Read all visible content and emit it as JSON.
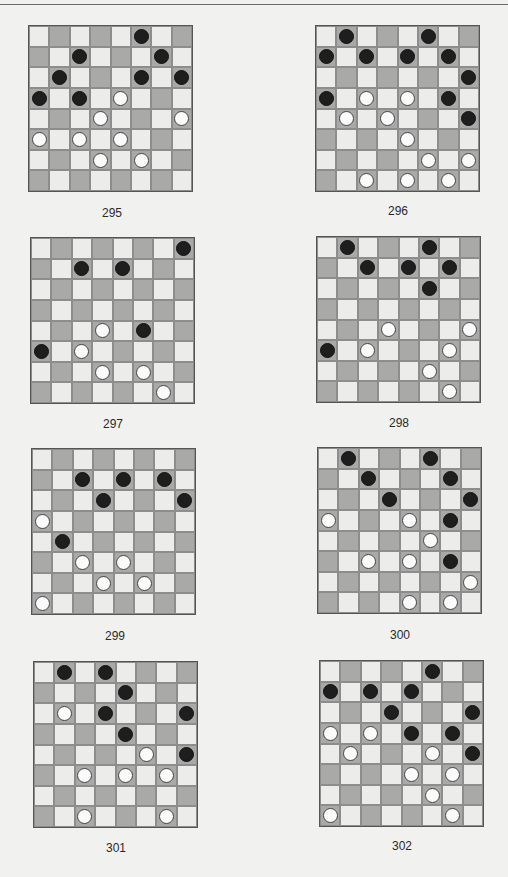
{
  "page": {
    "background": "#f1f1ef",
    "colors": {
      "light_square": "#ececea",
      "dark_square": "#a9a9a7",
      "black_piece": "#1e1e1e",
      "white_piece": "#fbfbfb"
    }
  },
  "diagrams": [
    {
      "number": "295",
      "black": [
        [
          0,
          5
        ],
        [
          1,
          2
        ],
        [
          1,
          6
        ],
        [
          2,
          1
        ],
        [
          2,
          5
        ],
        [
          2,
          7
        ],
        [
          3,
          0
        ],
        [
          3,
          2
        ]
      ],
      "white": [
        [
          3,
          4
        ],
        [
          4,
          3
        ],
        [
          4,
          7
        ],
        [
          5,
          0
        ],
        [
          5,
          2
        ],
        [
          5,
          4
        ],
        [
          6,
          3
        ],
        [
          6,
          5
        ]
      ]
    },
    {
      "number": "296",
      "black": [
        [
          0,
          1
        ],
        [
          0,
          5
        ],
        [
          1,
          0
        ],
        [
          1,
          2
        ],
        [
          1,
          4
        ],
        [
          1,
          6
        ],
        [
          2,
          7
        ],
        [
          3,
          0
        ],
        [
          3,
          6
        ],
        [
          4,
          7
        ]
      ],
      "white": [
        [
          3,
          2
        ],
        [
          3,
          4
        ],
        [
          4,
          1
        ],
        [
          4,
          3
        ],
        [
          5,
          4
        ],
        [
          6,
          5
        ],
        [
          6,
          7
        ],
        [
          7,
          2
        ],
        [
          7,
          4
        ],
        [
          7,
          6
        ]
      ]
    },
    {
      "number": "297",
      "black": [
        [
          0,
          7
        ],
        [
          1,
          2
        ],
        [
          1,
          4
        ],
        [
          4,
          5
        ],
        [
          5,
          0
        ]
      ],
      "white": [
        [
          4,
          3
        ],
        [
          5,
          2
        ],
        [
          6,
          3
        ],
        [
          6,
          5
        ],
        [
          7,
          6
        ]
      ]
    },
    {
      "number": "298",
      "black": [
        [
          0,
          1
        ],
        [
          0,
          5
        ],
        [
          1,
          2
        ],
        [
          1,
          4
        ],
        [
          1,
          6
        ],
        [
          2,
          5
        ],
        [
          5,
          0
        ]
      ],
      "white": [
        [
          4,
          3
        ],
        [
          4,
          7
        ],
        [
          5,
          2
        ],
        [
          5,
          6
        ],
        [
          6,
          5
        ],
        [
          7,
          6
        ]
      ]
    },
    {
      "number": "299",
      "black": [
        [
          1,
          2
        ],
        [
          1,
          4
        ],
        [
          1,
          6
        ],
        [
          2,
          3
        ],
        [
          2,
          7
        ],
        [
          4,
          1
        ]
      ],
      "white": [
        [
          3,
          0
        ],
        [
          5,
          2
        ],
        [
          5,
          4
        ],
        [
          6,
          3
        ],
        [
          6,
          5
        ],
        [
          7,
          0
        ]
      ]
    },
    {
      "number": "300",
      "black": [
        [
          0,
          1
        ],
        [
          0,
          5
        ],
        [
          1,
          2
        ],
        [
          1,
          6
        ],
        [
          2,
          3
        ],
        [
          2,
          7
        ],
        [
          3,
          6
        ],
        [
          5,
          6
        ]
      ],
      "white": [
        [
          3,
          0
        ],
        [
          3,
          4
        ],
        [
          4,
          5
        ],
        [
          5,
          2
        ],
        [
          5,
          4
        ],
        [
          6,
          7
        ],
        [
          7,
          4
        ],
        [
          7,
          6
        ]
      ]
    },
    {
      "number": "301",
      "black": [
        [
          0,
          1
        ],
        [
          0,
          3
        ],
        [
          1,
          4
        ],
        [
          2,
          3
        ],
        [
          2,
          7
        ],
        [
          3,
          4
        ],
        [
          4,
          7
        ]
      ],
      "white": [
        [
          2,
          1
        ],
        [
          4,
          5
        ],
        [
          5,
          2
        ],
        [
          5,
          4
        ],
        [
          5,
          6
        ],
        [
          7,
          2
        ],
        [
          7,
          6
        ]
      ]
    },
    {
      "number": "302",
      "black": [
        [
          0,
          5
        ],
        [
          1,
          0
        ],
        [
          1,
          2
        ],
        [
          1,
          4
        ],
        [
          2,
          3
        ],
        [
          2,
          7
        ],
        [
          3,
          4
        ],
        [
          3,
          6
        ],
        [
          4,
          7
        ]
      ],
      "white": [
        [
          3,
          0
        ],
        [
          3,
          2
        ],
        [
          4,
          1
        ],
        [
          4,
          5
        ],
        [
          5,
          4
        ],
        [
          5,
          6
        ],
        [
          6,
          5
        ],
        [
          7,
          0
        ],
        [
          7,
          6
        ]
      ]
    }
  ]
}
